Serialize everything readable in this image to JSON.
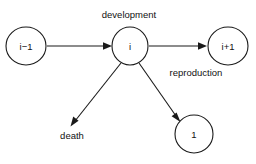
{
  "diagram": {
    "title": "",
    "background_color": "#ffffff",
    "stroke_color": "#1a1a1a",
    "text_color": "#111111",
    "nodes": [
      {
        "id": "prev",
        "label": "i−1",
        "cx": 26,
        "cy": 46,
        "rx": 20,
        "ry": 19
      },
      {
        "id": "current",
        "label": "i",
        "cx": 130,
        "cy": 46,
        "rx": 18,
        "ry": 19
      },
      {
        "id": "next",
        "label": "i+1",
        "cx": 228,
        "cy": 46,
        "rx": 20,
        "ry": 19
      },
      {
        "id": "newborn",
        "label": "1",
        "cx": 194,
        "cy": 134,
        "rx": 19,
        "ry": 19
      }
    ],
    "edges": [
      {
        "id": "development-edge",
        "from": "prev",
        "to": "current",
        "label": "development",
        "label_x": 129,
        "label_y": 15
      },
      {
        "id": "reproduction-edge",
        "from": "current",
        "to": "newborn",
        "label": "reproduction",
        "label_x": 196,
        "label_y": 73
      },
      {
        "id": "growth-edge",
        "from": "current",
        "to": "next",
        "label": "",
        "label_x": 0,
        "label_y": 0
      },
      {
        "id": "death-edge",
        "from": "current",
        "to": "death",
        "label": "death",
        "label_x": 72,
        "label_y": 136
      }
    ]
  }
}
